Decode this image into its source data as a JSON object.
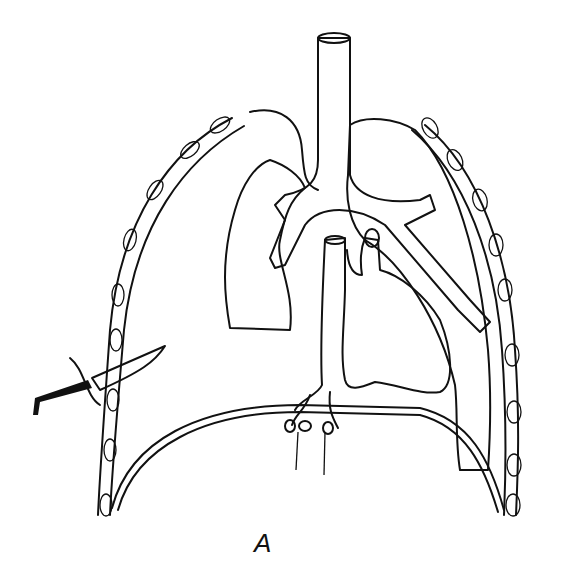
{
  "figure": {
    "caption": "A",
    "parts": [
      {
        "name": "trachea"
      },
      {
        "name": "left-lung-collapsed"
      },
      {
        "name": "right-lung"
      },
      {
        "name": "heart-and-great-vessels"
      },
      {
        "name": "diaphragm"
      },
      {
        "name": "chest-wall-ribs"
      },
      {
        "name": "knife"
      }
    ],
    "colors": {
      "line": "#111111",
      "background": "#ffffff",
      "knife_handle": "#111111"
    }
  }
}
